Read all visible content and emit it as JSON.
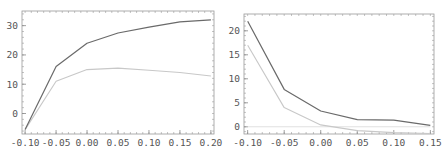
{
  "chart_data": [
    {
      "type": "line",
      "title": "",
      "xlabel": "",
      "ylabel": "",
      "x": [
        -0.1,
        -0.05,
        0.0,
        0.05,
        0.1,
        0.15,
        0.2
      ],
      "series": [
        {
          "name": "dark",
          "color": "#6a6a6a",
          "values": [
            -5.5,
            16,
            24,
            27.5,
            29.5,
            31.3,
            32
          ]
        },
        {
          "name": "light",
          "color": "#c8c8c8",
          "values": [
            -5.5,
            11,
            15,
            15.5,
            14.8,
            14,
            12.8
          ]
        }
      ],
      "xlim": [
        -0.105,
        0.205
      ],
      "ylim": [
        -7,
        35
      ],
      "xticks": [
        "-0.10",
        "-0.05",
        "0.00",
        "0.05",
        "0.10",
        "0.15",
        "0.20"
      ],
      "yticks": [
        "0",
        "10",
        "20",
        "30"
      ],
      "grid": false,
      "legend": "none"
    },
    {
      "type": "line",
      "title": "",
      "xlabel": "",
      "ylabel": "",
      "x": [
        -0.1,
        -0.05,
        0.0,
        0.05,
        0.1,
        0.15
      ],
      "series": [
        {
          "name": "dark",
          "color": "#6a6a6a",
          "values": [
            22,
            7.8,
            3.3,
            1.5,
            1.4,
            0.3
          ]
        },
        {
          "name": "light",
          "color": "#c8c8c8",
          "values": [
            17,
            4,
            0.4,
            -0.8,
            -1.2,
            -1.4
          ]
        },
        {
          "name": "baseline",
          "color": "#e0e0e0",
          "values": [
            0,
            0,
            0,
            0,
            0,
            0
          ]
        }
      ],
      "xlim": [
        -0.105,
        0.155
      ],
      "ylim": [
        -1.5,
        23.5
      ],
      "xticks": [
        "-0.10",
        "-0.05",
        "0.00",
        "0.05",
        "0.10",
        "0.15"
      ],
      "yticks": [
        "0",
        "5",
        "10",
        "15",
        "20"
      ],
      "grid": false,
      "legend": "none"
    }
  ]
}
